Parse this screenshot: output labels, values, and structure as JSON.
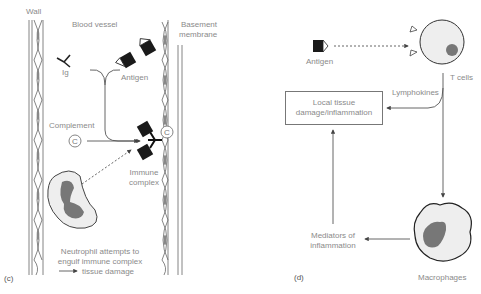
{
  "panel_c": {
    "label": "(c)",
    "wall": "Wall",
    "blood_vessel": "Blood vessel",
    "basement_line1": "Basement",
    "basement_line2": "membrane",
    "ig": "Ig",
    "antigen": "Antigen",
    "complement": "Complement",
    "complement_symbol": "C",
    "immune_line1": "Immune",
    "immune_line2": "complex",
    "neutrophil_line1": "Neutrophil attempts to",
    "neutrophil_line2": "engulf immune complex",
    "neutrophil_line3": "tissue damage"
  },
  "panel_d": {
    "label": "(d)",
    "antigen": "Antigen",
    "t_cells": "T cells",
    "lymphokines": "Lymphokines",
    "box_line1": "Local tissue",
    "box_line2": "damage/inflammation",
    "mediators_line1": "Mediators of",
    "mediators_line2": "inflammation",
    "macrophages": "Macrophages"
  },
  "colors": {
    "line": "#555555",
    "text": "#8a8a8a",
    "cell_fill": "#eeeeee",
    "nucleus": "#777777",
    "antigen": "#1a1a1a"
  }
}
